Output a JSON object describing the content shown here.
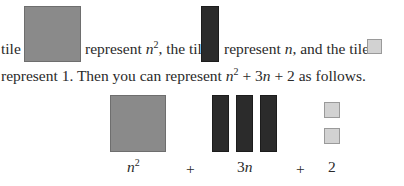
{
  "line1": {
    "seg1": "tile",
    "seg2": "represent",
    "n": "n",
    "sq": "2",
    "seg3": ", the tile",
    "seg4": "represent",
    "n2": "n",
    "seg5": ", and the tile"
  },
  "line2": {
    "seg1": "represent 1. Then you can represent",
    "n": "n",
    "sq": "2",
    "seg2": "+ 3",
    "n2": "n",
    "seg3": "+ 2 as follows."
  },
  "figure": {
    "label_n": "n",
    "label_sq": "2",
    "plus1": "+",
    "label_3n_coef": "3",
    "label_3n_var": "n",
    "plus2": "+",
    "label_2": "2"
  },
  "colors": {
    "square_tile": "#8a8a8a",
    "bar_tile": "#2b2b2b",
    "unit_tile": "#d2d2d2"
  }
}
